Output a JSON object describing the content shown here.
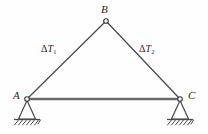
{
  "figure": {
    "type": "structural-truss-diagram",
    "background_color": "#fefefe",
    "line_color": "#4a4a4a",
    "chord_color": "#6b6b6b",
    "text_color": "#2b2b2b"
  },
  "labels": {
    "apex": "B",
    "left_support": "A",
    "right_support": "C",
    "left_member": {
      "symbol": "Δ",
      "variable": "T",
      "subscript": "1"
    },
    "right_member": {
      "symbol": "Δ",
      "variable": "T",
      "subscript": "2"
    }
  },
  "geometry": {
    "joints": [
      {
        "name": "B",
        "x": 106,
        "y": 21
      },
      {
        "name": "A",
        "x": 27,
        "y": 99
      },
      {
        "name": "C",
        "x": 180,
        "y": 99
      }
    ],
    "members": [
      {
        "name": "AB",
        "from": "A",
        "to": "B",
        "label": "ΔT1"
      },
      {
        "name": "BC",
        "from": "B",
        "to": "C",
        "label": "ΔT2"
      },
      {
        "name": "AC",
        "from": "A",
        "to": "C",
        "label": ""
      }
    ],
    "supports": [
      {
        "at": "A",
        "kind": "pin",
        "ground_y": 120,
        "hatch_count": 7
      },
      {
        "at": "C",
        "kind": "pin",
        "ground_y": 120,
        "hatch_count": 7
      }
    ]
  }
}
